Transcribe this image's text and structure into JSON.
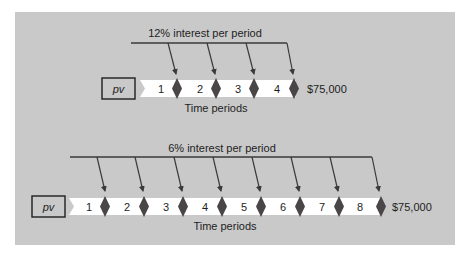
{
  "colors": {
    "panel_bg": "#c9c9c9",
    "timeline_fill": "#ffffff",
    "diamond": "#4a4648",
    "line": "#3a3a3a",
    "text": "#1e1e1e"
  },
  "diagrams": [
    {
      "id": "top",
      "interest_label": "12% interest per period",
      "pv_label": "pv",
      "periods": [
        "1",
        "2",
        "3",
        "4"
      ],
      "future_value": "$75,000",
      "axis_label": "Time periods"
    },
    {
      "id": "bottom",
      "interest_label": "6% interest per period",
      "pv_label": "pv",
      "periods": [
        "1",
        "2",
        "3",
        "4",
        "5",
        "6",
        "7",
        "8"
      ],
      "future_value": "$75,000",
      "axis_label": "Time periods"
    }
  ]
}
